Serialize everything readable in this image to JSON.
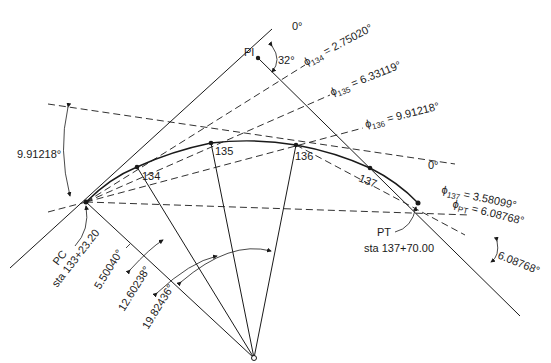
{
  "figure": {
    "type": "horizontal circular curve layout by deflection angles",
    "points": {
      "PI": {
        "label": "PI"
      },
      "PC": {
        "label": "PC",
        "station": "sta 133+23.20"
      },
      "PT": {
        "label": "PT",
        "station": "sta 137+70.00"
      }
    },
    "stations": [
      {
        "label": "134"
      },
      {
        "label": "135"
      },
      {
        "label": "136"
      },
      {
        "label": "137"
      }
    ],
    "intersection_angle": "32°",
    "reference_zero": "0°",
    "reference_zero_2": "0°",
    "deflections": [
      {
        "symbol": "ϕ",
        "sub": "134",
        "value": " = 2.75020°"
      },
      {
        "symbol": "ϕ",
        "sub": "135",
        "value": " = 6.33119°"
      },
      {
        "symbol": "ϕ",
        "sub": "136",
        "value": " = 9.91218°"
      },
      {
        "symbol": "ϕ",
        "sub": "137",
        "value": " = 3.58099°"
      },
      {
        "symbol": "ϕ",
        "sub": "PT",
        "value": " = 6.08768°"
      }
    ],
    "angle_labels": {
      "left_tangent_angle": "9.91218°",
      "pt_tangent_angle": "6.08768°",
      "central_134": "5.50040°",
      "central_135": "12.60238°",
      "central_136": "19.82436°"
    }
  }
}
